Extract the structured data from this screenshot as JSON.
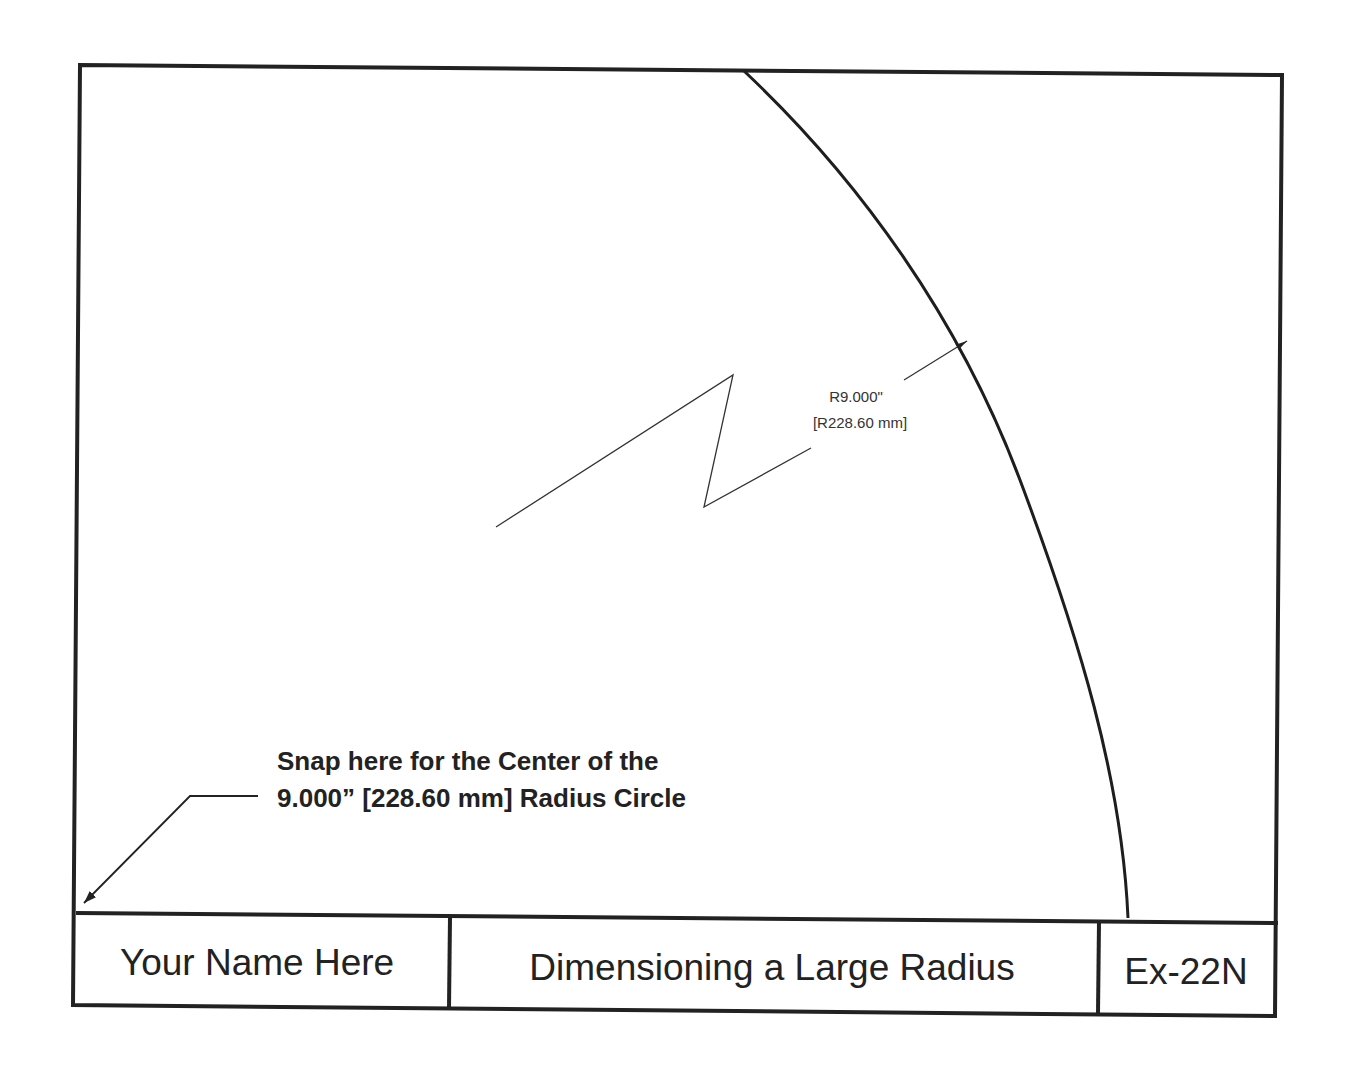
{
  "drawing": {
    "title_block": {
      "name": "Your Name Here",
      "title": "Dimensioning a Large Radius",
      "number": "Ex-22N"
    },
    "dimension": {
      "line1": "R9.000\"",
      "line2": "[R228.60 mm]"
    },
    "note": {
      "line1": "Snap here for the Center of the",
      "line2": "9.000” [228.60 mm] Radius Circle"
    },
    "colors": {
      "line": "#222222",
      "background": "#ffffff"
    }
  }
}
